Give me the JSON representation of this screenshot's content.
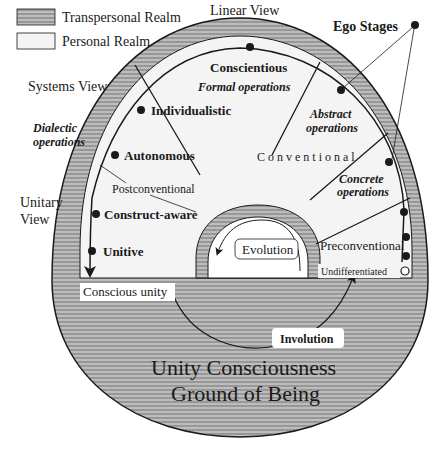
{
  "legend": {
    "items": [
      {
        "label": "Transpersonal Realm",
        "pattern": "hatched"
      },
      {
        "label": "Personal Realm",
        "pattern": "light"
      }
    ]
  },
  "views": {
    "linear": "Linear View",
    "systems": "Systems View",
    "unitary_line1": "Unitary",
    "unitary_line2": "View"
  },
  "ego_stages_label": "Ego Stages",
  "stages": {
    "conscientious": "Conscientious",
    "individualistic": "Individualistic",
    "autonomous": "Autonomous",
    "construct_aware": "Construct-aware",
    "unitive": "Unitive",
    "undifferentiated": "Undifferentiated"
  },
  "operations": {
    "formal": "Formal operations",
    "dialectic_line1": "Dialectic",
    "dialectic_line2": "operations",
    "abstract_line1": "Abstract",
    "abstract_line2": "operations",
    "concrete_line1": "Concrete",
    "concrete_line2": "operations"
  },
  "levels": {
    "postconventional": "Postconventional",
    "conventional": "Conventional",
    "preconventional": "Preconventional"
  },
  "processes": {
    "evolution": "Evolution",
    "involution": "Involution",
    "conscious_unity": "Conscious unity"
  },
  "ground": {
    "line1": "Unity Consciousness",
    "line2": "Ground of Being"
  },
  "colors": {
    "hatch_bg": "#b8b8b8",
    "hatch_line": "#7a7a7a",
    "personal": "#f4f4f4",
    "ink": "#1a1a1a"
  }
}
